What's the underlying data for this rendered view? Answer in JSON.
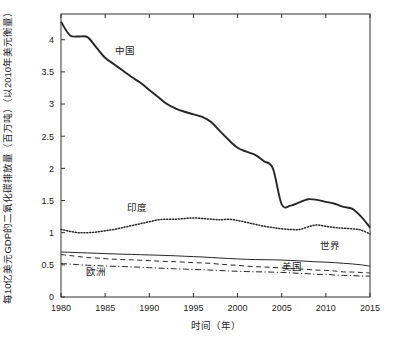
{
  "chart_data": {
    "type": "line",
    "title": "",
    "xlabel": "时间（年）",
    "ylabel": "每10亿美元GDP的二氧化碳排放量（百万吨）（以2010年美元衡量）",
    "xlim": [
      1980,
      2015
    ],
    "ylim": [
      0,
      4.4
    ],
    "xticks": [
      1980,
      1985,
      1990,
      1995,
      2000,
      2005,
      2010,
      2015
    ],
    "xticklabels": [
      "1980",
      "1985",
      "1990",
      "1995",
      "2000",
      "2005",
      "2010",
      "2015"
    ],
    "yticks": [
      0,
      0.5,
      1,
      1.5,
      2,
      2.5,
      3,
      3.5,
      4
    ],
    "yticklabels": [
      "0",
      "0.5",
      "1",
      "1.5",
      "2",
      "2.5",
      "3",
      "3.5",
      "4"
    ],
    "grid": false,
    "legend": "inline-annotations",
    "x": [
      1980,
      1981,
      1982,
      1983,
      1984,
      1985,
      1986,
      1987,
      1988,
      1989,
      1990,
      1991,
      1992,
      1993,
      1994,
      1995,
      1996,
      1997,
      1998,
      1999,
      2000,
      2001,
      2002,
      2003,
      2004,
      2005,
      2006,
      2007,
      2008,
      2009,
      2010,
      2011,
      2012,
      2013,
      2014,
      2015
    ],
    "series": [
      {
        "name": "中国",
        "style": "solid-thick",
        "label_position": {
          "x": 1987.2,
          "y": 3.78
        },
        "values": [
          4.28,
          4.07,
          4.05,
          4.04,
          3.88,
          3.72,
          3.62,
          3.52,
          3.42,
          3.33,
          3.22,
          3.11,
          3.0,
          2.93,
          2.88,
          2.84,
          2.8,
          2.72,
          2.58,
          2.44,
          2.32,
          2.26,
          2.21,
          2.11,
          2.0,
          1.44,
          1.42,
          1.47,
          1.52,
          1.51,
          1.48,
          1.45,
          1.4,
          1.37,
          1.25,
          1.08
        ]
      },
      {
        "name": "印度",
        "style": "dotted",
        "label_position": {
          "x": 1988.6,
          "y": 1.34
        },
        "values": [
          1.05,
          1.02,
          1.0,
          1.0,
          1.01,
          1.03,
          1.05,
          1.08,
          1.11,
          1.14,
          1.17,
          1.2,
          1.21,
          1.21,
          1.22,
          1.23,
          1.22,
          1.21,
          1.2,
          1.21,
          1.19,
          1.16,
          1.13,
          1.1,
          1.08,
          1.06,
          1.05,
          1.05,
          1.09,
          1.12,
          1.1,
          1.08,
          1.07,
          1.06,
          1.04,
          0.98
        ]
      },
      {
        "name": "世界",
        "style": "solid-thin",
        "label_position": {
          "x": 2010.5,
          "y": 0.74
        },
        "values": [
          0.7,
          0.695,
          0.69,
          0.685,
          0.68,
          0.675,
          0.67,
          0.665,
          0.662,
          0.658,
          0.654,
          0.65,
          0.645,
          0.64,
          0.634,
          0.628,
          0.622,
          0.614,
          0.606,
          0.598,
          0.592,
          0.586,
          0.582,
          0.58,
          0.578,
          0.574,
          0.568,
          0.562,
          0.554,
          0.546,
          0.542,
          0.534,
          0.524,
          0.514,
          0.5,
          0.48
        ]
      },
      {
        "name": "美国",
        "style": "dashed",
        "label_position": {
          "x": 2006.2,
          "y": 0.415
        },
        "values": [
          0.66,
          0.645,
          0.628,
          0.614,
          0.606,
          0.596,
          0.588,
          0.582,
          0.578,
          0.572,
          0.566,
          0.558,
          0.552,
          0.548,
          0.542,
          0.534,
          0.53,
          0.522,
          0.51,
          0.5,
          0.492,
          0.48,
          0.472,
          0.466,
          0.46,
          0.452,
          0.442,
          0.436,
          0.428,
          0.418,
          0.414,
          0.404,
          0.39,
          0.388,
          0.382,
          0.375
        ]
      },
      {
        "name": "欧洲",
        "style": "dash-dot",
        "label_position": {
          "x": 1984.0,
          "y": 0.345
        },
        "values": [
          0.52,
          0.512,
          0.502,
          0.494,
          0.488,
          0.482,
          0.478,
          0.474,
          0.468,
          0.462,
          0.456,
          0.45,
          0.444,
          0.438,
          0.434,
          0.428,
          0.424,
          0.418,
          0.412,
          0.404,
          0.4,
          0.396,
          0.392,
          0.39,
          0.386,
          0.382,
          0.376,
          0.368,
          0.362,
          0.352,
          0.352,
          0.342,
          0.336,
          0.332,
          0.326,
          0.325
        ]
      }
    ]
  }
}
